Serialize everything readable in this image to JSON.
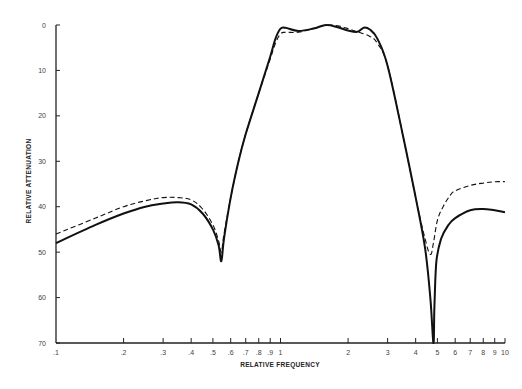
{
  "chart_data": {
    "type": "line",
    "title": "",
    "xlabel": "RELATIVE FREQUENCY",
    "ylabel": "RELATIVE ATTENUATION",
    "x_scale": "log",
    "xlim": [
      0.1,
      10
    ],
    "ylim": [
      70,
      0
    ],
    "y_inverted": true,
    "grid": false,
    "legend": null,
    "x_ticks": [
      {
        "value": 0.1,
        "label": ".1"
      },
      {
        "value": 0.2,
        "label": ".2"
      },
      {
        "value": 0.3,
        "label": ".3"
      },
      {
        "value": 0.4,
        "label": ".4"
      },
      {
        "value": 0.5,
        "label": ".5"
      },
      {
        "value": 0.6,
        "label": ".6"
      },
      {
        "value": 0.7,
        "label": ".7"
      },
      {
        "value": 0.8,
        "label": ".8"
      },
      {
        "value": 0.9,
        "label": ".9"
      },
      {
        "value": 1,
        "label": "1"
      },
      {
        "value": 2,
        "label": "2"
      },
      {
        "value": 3,
        "label": "3"
      },
      {
        "value": 4,
        "label": "4"
      },
      {
        "value": 5,
        "label": "5"
      },
      {
        "value": 6,
        "label": "6"
      },
      {
        "value": 7,
        "label": "7"
      },
      {
        "value": 8,
        "label": "8"
      },
      {
        "value": 9,
        "label": "9"
      },
      {
        "value": 10,
        "label": "10"
      }
    ],
    "y_ticks": [
      {
        "value": 0,
        "label": "0"
      },
      {
        "value": 10,
        "label": "10"
      },
      {
        "value": 20,
        "label": "20"
      },
      {
        "value": 30,
        "label": "30"
      },
      {
        "value": 40,
        "label": "40"
      },
      {
        "value": 50,
        "label": "50"
      },
      {
        "value": 60,
        "label": "60"
      },
      {
        "value": 70,
        "label": "70"
      }
    ],
    "series": [
      {
        "name": "solid",
        "style": "solid",
        "x": [
          0.1,
          0.15,
          0.2,
          0.25,
          0.3,
          0.35,
          0.4,
          0.45,
          0.5,
          0.53,
          0.545,
          0.56,
          0.6,
          0.65,
          0.7,
          0.8,
          0.9,
          0.95,
          1.0,
          1.05,
          1.2,
          1.4,
          1.6,
          1.8,
          2.0,
          2.2,
          2.35,
          2.5,
          2.7,
          3.0,
          3.5,
          4.0,
          4.4,
          4.65,
          4.8,
          4.85,
          4.95,
          5.2,
          5.6,
          6.0,
          7.0,
          8.0,
          9.0,
          10.0
        ],
        "y": [
          48,
          44,
          41.5,
          40,
          39.3,
          39,
          39.5,
          41.5,
          45,
          48.5,
          52,
          47,
          38,
          30,
          24,
          15,
          7,
          3,
          0.8,
          0.6,
          1.3,
          0.8,
          0,
          0.5,
          1.2,
          1.5,
          0.6,
          1.0,
          3.0,
          9,
          24,
          38,
          49,
          60,
          70,
          62,
          52,
          47,
          44,
          42.5,
          40.8,
          40.5,
          40.8,
          41.2
        ]
      },
      {
        "name": "dashed",
        "style": "dashed",
        "x": [
          0.1,
          0.15,
          0.2,
          0.25,
          0.3,
          0.35,
          0.4,
          0.45,
          0.5,
          0.53,
          0.545,
          0.56,
          0.6,
          0.65,
          0.7,
          0.8,
          0.9,
          0.95,
          1.0,
          1.05,
          1.2,
          1.4,
          1.6,
          1.8,
          2.0,
          2.2,
          2.5,
          2.7,
          3.0,
          3.5,
          4.0,
          4.4,
          4.65,
          4.8,
          5.0,
          5.3,
          5.7,
          6.0,
          7.0,
          8.0,
          9.0,
          10.0
        ],
        "y": [
          46,
          42.5,
          40,
          38.7,
          38,
          38,
          38.5,
          40.5,
          44,
          47.5,
          50,
          46,
          38,
          30,
          24,
          15,
          7.5,
          4,
          2,
          1.6,
          1.6,
          0.8,
          0,
          0.2,
          0.8,
          1.5,
          2.5,
          4,
          9,
          24,
          38,
          47,
          50.5,
          48,
          43,
          40,
          37.5,
          36.5,
          35.3,
          34.8,
          34.5,
          34.5
        ]
      }
    ]
  }
}
